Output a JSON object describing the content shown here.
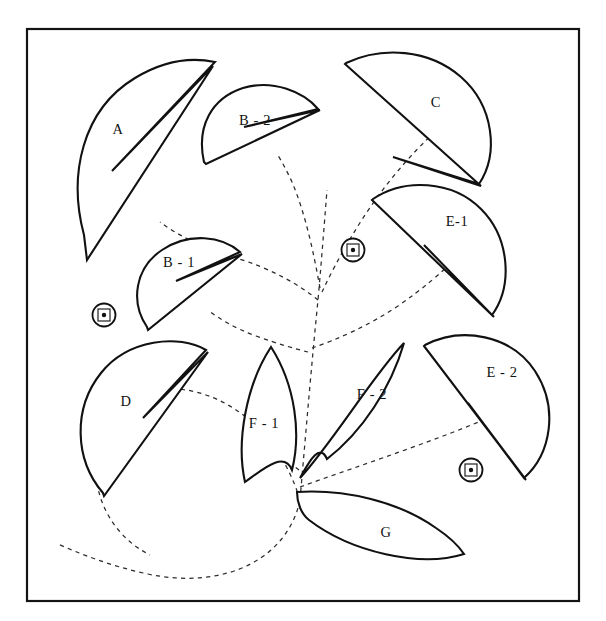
{
  "figure": {
    "kind": "line-drawing",
    "background_color": "#ffffff",
    "outline_color": "#111111",
    "stem_color": "#2b2b2b",
    "frame": {
      "x": 27,
      "y": 29,
      "width": 552,
      "height": 572,
      "stroke_width": 2.2
    },
    "labels": [
      {
        "id": "A",
        "text": "A",
        "x": 118,
        "y": 131
      },
      {
        "id": "B2",
        "text": "B - 2",
        "x": 255,
        "y": 122
      },
      {
        "id": "C",
        "text": "C",
        "x": 436,
        "y": 104
      },
      {
        "id": "B1",
        "text": "B - 1",
        "x": 179,
        "y": 264
      },
      {
        "id": "E1",
        "text": "E-1",
        "x": 457,
        "y": 223
      },
      {
        "id": "D",
        "text": "D",
        "x": 126,
        "y": 403
      },
      {
        "id": "F1",
        "text": "F - 1",
        "x": 264,
        "y": 425
      },
      {
        "id": "F2",
        "text": "F - 2",
        "x": 372,
        "y": 396
      },
      {
        "id": "E2",
        "text": "E - 2",
        "x": 502,
        "y": 374
      },
      {
        "id": "G",
        "text": "G",
        "x": 386,
        "y": 534
      }
    ],
    "markers": [
      {
        "id": "marker-left",
        "cx": 104,
        "cy": 315,
        "r": 11.5,
        "square": 12,
        "dot": 2.2
      },
      {
        "id": "marker-center",
        "cx": 353,
        "cy": 250,
        "r": 11.5,
        "square": 12,
        "dot": 2.2
      },
      {
        "id": "marker-right",
        "cx": 471,
        "cy": 470,
        "r": 11.5,
        "square": 12,
        "dot": 2.2
      }
    ],
    "shapes": [
      {
        "id": "A",
        "name": "leaf-A",
        "path": "M 84 235 C 68 175 82 110 135 78 C 168 58 196 58 215 62 L 112 171 L 213 66 L 87 260 Z"
      },
      {
        "id": "B2",
        "name": "leaf-B2",
        "path": "M 204 162 C 196 126 212 98 243 88 C 273 79 304 92 318 109 L 244 127 L 320 110 L 206 164 Z"
      },
      {
        "id": "C",
        "name": "leaf-C",
        "path": "M 346 63 C 382 46 429 49 461 77 C 494 106 499 154 479 184 L 393 157 L 481 186 L 345 64 Z"
      },
      {
        "id": "B1",
        "name": "leaf-B1",
        "path": "M 147 327 C 130 302 135 268 162 250 C 189 232 222 236 240 252 L 176 281 L 242 254 L 148 330 Z"
      },
      {
        "id": "E1",
        "name": "leaf-E1",
        "path": "M 373 199 C 404 178 452 180 481 209 C 510 238 513 286 492 315 L 424 245 L 494 317 L 372 200 Z"
      },
      {
        "id": "D",
        "name": "leaf-D",
        "path": "M 103 493 C 74 459 73 408 101 373 C 128 339 179 334 206 350 L 143 418 L 208 352 L 104 496 Z"
      },
      {
        "id": "F1",
        "name": "leaf-F1",
        "path": "M 271 347 C 296 386 301 435 292 470 C 284 450 262 470 245 482 C 236 442 246 385 271 347 Z"
      },
      {
        "id": "F2",
        "name": "leaf-F2",
        "path": "M 404 343 C 391 388 362 432 327 459 C 319 440 306 468 300 478 C 333 442 374 374 404 343 Z"
      },
      {
        "id": "E2",
        "name": "leaf-E2",
        "path": "M 425 345 C 462 326 511 335 535 371 C 559 408 551 454 524 478 L 468 403 L 526 480 L 424 346 Z"
      },
      {
        "id": "G",
        "name": "leaf-G",
        "path": "M 297 492 C 344 489 398 501 436 528 C 451 538 460 548 464 554 C 420 568 351 552 309 520 C 301 514 297 502 297 492 Z"
      }
    ],
    "stems": [
      {
        "id": "stem-main",
        "path": "M 300 500 C 306 430 312 360 318 300 C 322 255 325 215 327 190"
      },
      {
        "id": "stem-to-A",
        "path": "M 318 300 C 300 285 270 268 236 258 C 208 250 180 237 160 222"
      },
      {
        "id": "stem-to-B2",
        "path": "M 320 288 C 314 255 306 215 292 182 C 286 169 281 160 277 154"
      },
      {
        "id": "stem-to-C",
        "path": "M 322 292 C 338 258 362 215 392 178 C 410 156 424 142 434 133"
      },
      {
        "id": "stem-to-B1",
        "path": "M 308 352 C 296 349 278 344 256 336 C 234 328 218 318 208 310"
      },
      {
        "id": "stem-to-E1",
        "path": "M 312 348 C 336 340 368 326 398 306 C 424 288 442 272 452 262"
      },
      {
        "id": "stem-to-F1",
        "path": "M 299 470 C 290 463 277 456 262 452"
      },
      {
        "id": "stem-to-E2",
        "path": "M 300 487 C 330 476 372 462 416 446 C 452 433 480 422 496 414"
      },
      {
        "id": "stem-lower",
        "path": "M 300 500 C 296 520 284 542 262 557 C 232 578 190 583 148 574 C 110 566 78 553 58 544"
      },
      {
        "id": "stem-loop",
        "path": "M 300 500 C 294 480 283 455 262 432 C 236 404 204 391 178 389 C 150 387 126 398 110 420 C 94 442 92 470 100 496 C 108 522 126 543 150 555"
      }
    ]
  }
}
